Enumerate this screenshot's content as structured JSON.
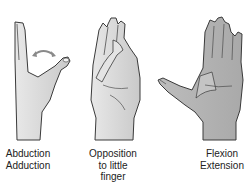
{
  "figure": {
    "panels": [
      {
        "id": "abduction",
        "lines": [
          "Abduction",
          "Adduction"
        ],
        "icon": "hand-thumb-abduction-icon"
      },
      {
        "id": "opposition",
        "lines": [
          "Opposition",
          "to little",
          "finger"
        ],
        "icon": "hand-thumb-opposition-icon"
      },
      {
        "id": "flexion",
        "lines": [
          "Flexion",
          "Extension"
        ],
        "icon": "hand-thumb-flexion-icon"
      }
    ],
    "colors": {
      "skin": "#d9d9d9",
      "outline": "#3a3a3a",
      "arrow": "#8a8a8a"
    }
  }
}
